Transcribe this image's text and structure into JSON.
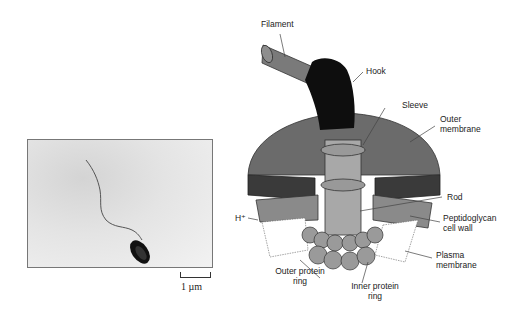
{
  "micrograph": {
    "scale_bar_label": "1 µm"
  },
  "diagram": {
    "labels": {
      "filament": "Filament",
      "hook": "Hook",
      "sleeve": "Sleeve",
      "outer_membrane_1": "Outer",
      "outer_membrane_2": "membrane",
      "rod": "Rod",
      "h_plus": "H⁺",
      "peptidoglycan_1": "Peptidoglycan",
      "peptidoglycan_2": "cell wall",
      "plasma_1": "Plasma",
      "plasma_2": "membrane",
      "outer_ring_1": "Outer protein",
      "outer_ring_2": "ring",
      "inner_ring_1": "Inner protein",
      "inner_ring_2": "ring"
    },
    "colors": {
      "filament": "#7a7a7a",
      "hook": "#0e0e0e",
      "outer_membrane_top": "#6b6b6b",
      "outer_membrane_side": "#3a3a3a",
      "cell_wall": "#8a8a8a",
      "rod": "#a8a8a8",
      "rings": "#9a9a9a"
    }
  }
}
